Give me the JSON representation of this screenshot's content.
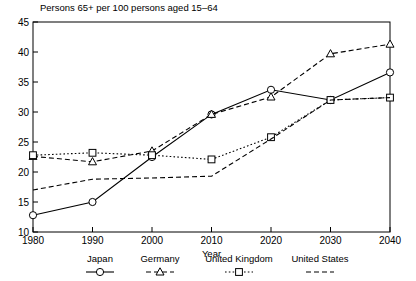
{
  "chart_data": {
    "type": "line",
    "title": "Persons 65+ per 100 persons aged 15–64",
    "xlabel": "Year",
    "ylabel": "",
    "x": [
      1980,
      1990,
      2000,
      2010,
      2020,
      2030,
      2040
    ],
    "xlim": [
      1980,
      2040
    ],
    "ylim": [
      10,
      45
    ],
    "xticks": [
      "1980",
      "1990",
      "2000",
      "2010",
      "2020",
      "2030",
      "2040"
    ],
    "yticks": [
      "10",
      "15",
      "20",
      "25",
      "30",
      "35",
      "40",
      "45"
    ],
    "grid": false,
    "legend_position": "bottom",
    "series": [
      {
        "name": "Japan",
        "marker": "circle",
        "linestyle": "solid",
        "color": "#000000",
        "values": [
          12.8,
          15.0,
          22.5,
          29.6,
          33.7,
          32.0,
          36.6
        ]
      },
      {
        "name": "Germany",
        "marker": "triangle",
        "linestyle": "dashed",
        "color": "#000000",
        "values": [
          22.6,
          21.7,
          23.5,
          29.6,
          32.5,
          39.7,
          41.3
        ]
      },
      {
        "name": "United Kingdom",
        "marker": "square",
        "linestyle": "dotted",
        "color": "#000000",
        "values": [
          22.8,
          23.2,
          22.8,
          22.1,
          25.8,
          32.0,
          32.4
        ]
      },
      {
        "name": "United States",
        "marker": "none",
        "linestyle": "dashed",
        "color": "#000000",
        "values": [
          17.0,
          18.8,
          19.0,
          19.3,
          25.5,
          32.0,
          32.4
        ]
      }
    ]
  },
  "legend": {
    "items": [
      {
        "label": "Japan",
        "marker": "circle",
        "linestyle": "solid"
      },
      {
        "label": "Germany",
        "marker": "triangle",
        "linestyle": "dashed"
      },
      {
        "label": "United Kingdom",
        "marker": "square",
        "linestyle": "dotted"
      },
      {
        "label": "United States",
        "marker": "none",
        "linestyle": "dashed"
      }
    ]
  }
}
